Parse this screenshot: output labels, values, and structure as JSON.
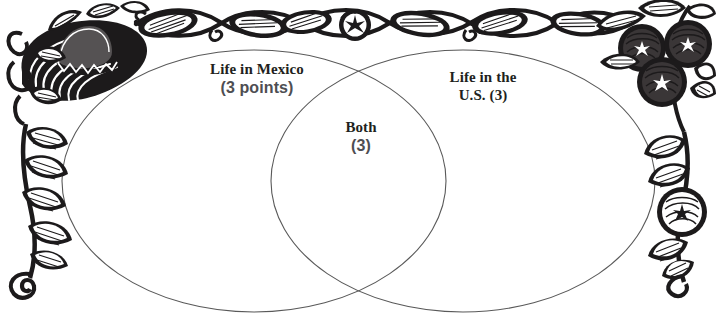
{
  "page": {
    "background_color": "#ffffff",
    "width": 716,
    "height": 322
  },
  "venn": {
    "stroke_color": "#595959",
    "stroke_width": 1,
    "fill": "none",
    "left_circle": {
      "label_line1": "Life in Mexico",
      "label_line2": "(3 points)",
      "cx": 254,
      "cy": 181,
      "rx": 192,
      "ry": 131
    },
    "right_circle": {
      "label_line1": "Life in the",
      "label_line2": "U.S. (3)",
      "cx": 463,
      "cy": 181,
      "rx": 192,
      "ry": 131
    },
    "intersection": {
      "label_line1": "Both",
      "label_line2": "(3)"
    }
  },
  "colors": {
    "ink": "#221f20",
    "gray_text": "#4e4e52",
    "outline": "#595959",
    "ornament": "#1c1a1b",
    "ornament_mid": "#555253"
  },
  "ornaments": {
    "top_left": "sombrero-woodcut-icon",
    "top_right": "berries-woodcut-icon",
    "top_border": "leaf-vine-border-icon",
    "top_border_center": "flower-node-icon",
    "left_border": "leaf-vine-vertical-left-icon",
    "right_border": "leaf-vine-vertical-right-icon"
  }
}
